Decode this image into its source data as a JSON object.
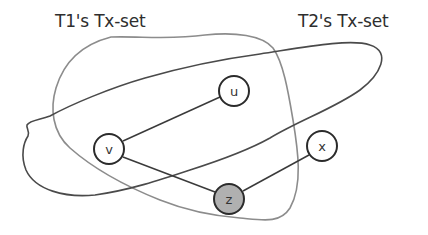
{
  "diagram": {
    "labels": {
      "t1_set": "T1's Tx-set",
      "t2_set": "T2's Tx-set"
    },
    "sets": [
      {
        "id": "t1",
        "name": "T1's Tx-set",
        "stroke": "#8c8c8c"
      },
      {
        "id": "t2",
        "name": "T2's Tx-set",
        "stroke": "#4a4a4a"
      }
    ],
    "nodes": [
      {
        "id": "u",
        "label": "u",
        "cx": 234,
        "cy": 91,
        "fill": "#ffffff",
        "in_sets": [
          "t1",
          "t2"
        ]
      },
      {
        "id": "v",
        "label": "v",
        "cx": 109,
        "cy": 149,
        "fill": "#ffffff",
        "in_sets": [
          "t1",
          "t2"
        ]
      },
      {
        "id": "x",
        "label": "x",
        "cx": 322,
        "cy": 146,
        "fill": "#ffffff",
        "in_sets": []
      },
      {
        "id": "z",
        "label": "z",
        "cx": 229,
        "cy": 199,
        "fill": "#b0b0b0",
        "in_sets": [
          "t1"
        ]
      }
    ],
    "edges": [
      {
        "from": "v",
        "to": "u"
      },
      {
        "from": "v",
        "to": "z"
      },
      {
        "from": "z",
        "to": "x"
      }
    ],
    "colors": {
      "node_stroke": "#2b2b2b",
      "edge": "#3a3a3a",
      "highlight_node_fill": "#b0b0b0"
    }
  }
}
